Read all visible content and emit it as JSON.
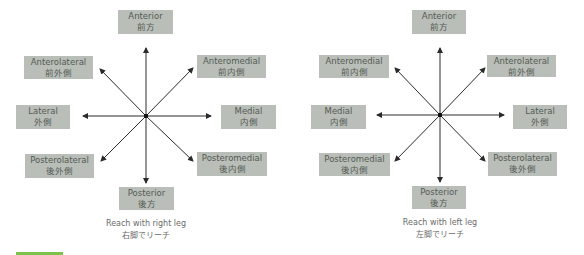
{
  "colors": {
    "box_fill": "#b9bfb8",
    "box_text": "#555a55",
    "arrow": "#2a2a2a",
    "caption_text": "#6a6a6a",
    "accent_bar": "#7dc24b"
  },
  "diagrams": [
    {
      "caption_en": "Reach with right leg",
      "caption_ja": "右脚でリーチ",
      "directions": {
        "anterior": {
          "en": "Anterior",
          "ja": "前方"
        },
        "upper_left": {
          "en": "Anterolateral",
          "ja": "前外側"
        },
        "upper_right": {
          "en": "Anteromedial",
          "ja": "前内側"
        },
        "left": {
          "en": "Lateral",
          "ja": "外側"
        },
        "right": {
          "en": "Medial",
          "ja": "内側"
        },
        "lower_left": {
          "en": "Posterolateral",
          "ja": "後外側"
        },
        "lower_right": {
          "en": "Posteromedial",
          "ja": "後内側"
        },
        "posterior": {
          "en": "Posterior",
          "ja": "後方"
        }
      }
    },
    {
      "caption_en": "Reach with left leg",
      "caption_ja": "左脚でリーチ",
      "directions": {
        "anterior": {
          "en": "Anterior",
          "ja": "前方"
        },
        "upper_left": {
          "en": "Anteromedial",
          "ja": "前内側"
        },
        "upper_right": {
          "en": "Anterolateral",
          "ja": "前外側"
        },
        "left": {
          "en": "Medial",
          "ja": "内側"
        },
        "right": {
          "en": "Lateral",
          "ja": "外側"
        },
        "lower_left": {
          "en": "Posteromedial",
          "ja": "後内側"
        },
        "lower_right": {
          "en": "Posterolateral",
          "ja": "後外側"
        },
        "posterior": {
          "en": "Posterior",
          "ja": "後方"
        }
      }
    }
  ]
}
